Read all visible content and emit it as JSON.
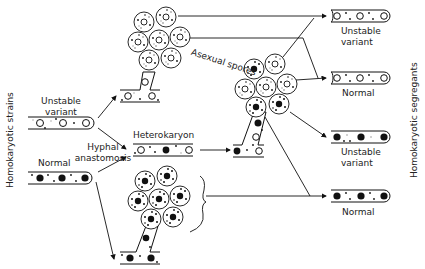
{
  "diagram": {
    "left_axis_label": "Homokaryotic strains",
    "right_axis_label": "Homokaryotic segregants",
    "inputs": {
      "unstable_variant": {
        "line1": "Unstable",
        "line2": "variant"
      },
      "normal": "Normal"
    },
    "process": {
      "anastomosis_line1": "Hyphal",
      "anastomosis_line2": "anastomosis",
      "heterokaryon": "Heterokaryon",
      "asexual_spores": "Asexual spores"
    },
    "outputs": [
      {
        "line1": "Unstable",
        "line2": "variant",
        "nuclei": "open"
      },
      {
        "line1": "Normal",
        "line2": "",
        "nuclei": "open"
      },
      {
        "line1": "Unstable",
        "line2": "variant",
        "nuclei": "filled"
      },
      {
        "line1": "Normal",
        "line2": "",
        "nuclei": "filled"
      }
    ],
    "colors": {
      "ink": "#111111",
      "paper": "#ffffff",
      "faint": "#9a9a9a"
    }
  }
}
